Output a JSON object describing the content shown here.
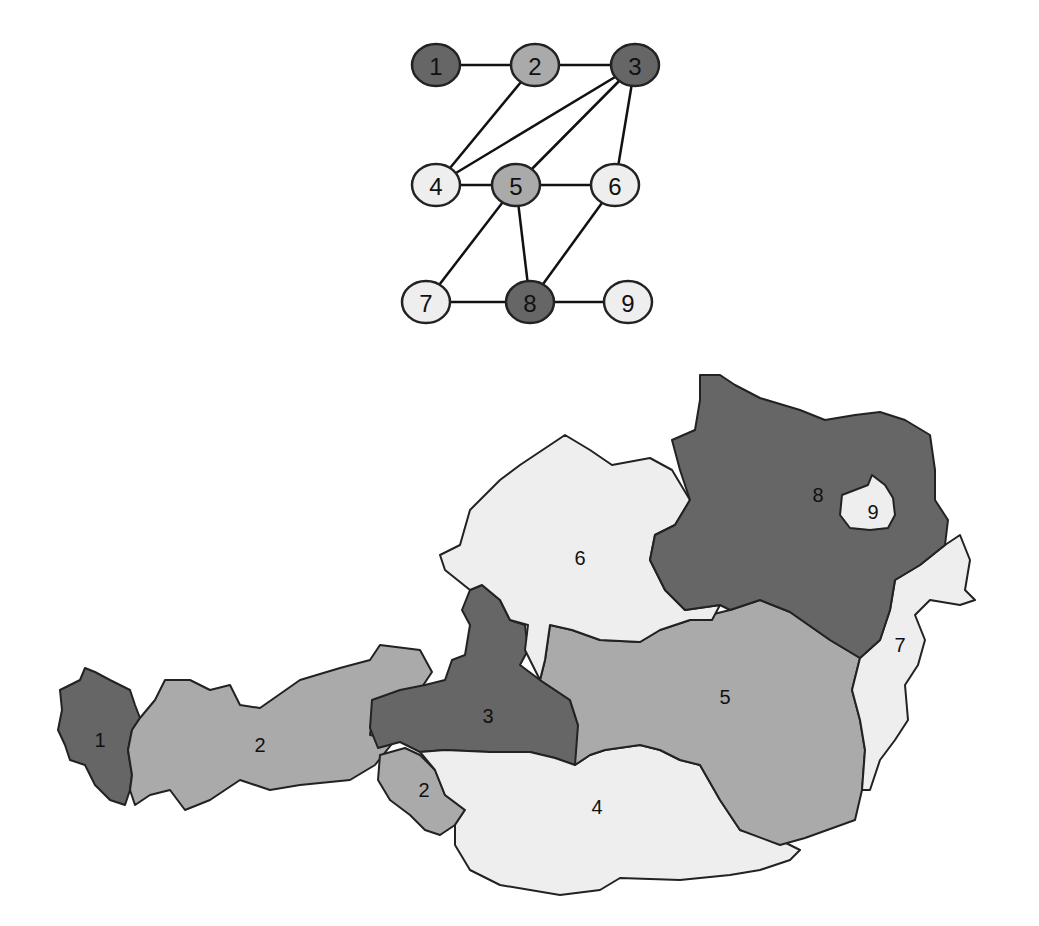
{
  "colors": {
    "dark": "#666666",
    "medium": "#aaaaaa",
    "light": "#eeeeee"
  },
  "graph": {
    "nodes": [
      {
        "id": "1",
        "label": "1",
        "x": 436,
        "y": 65,
        "shade": "dark"
      },
      {
        "id": "2",
        "label": "2",
        "x": 535,
        "y": 65,
        "shade": "medium"
      },
      {
        "id": "3",
        "label": "3",
        "x": 635,
        "y": 65,
        "shade": "dark"
      },
      {
        "id": "4",
        "label": "4",
        "x": 436,
        "y": 185,
        "shade": "light"
      },
      {
        "id": "5",
        "label": "5",
        "x": 516,
        "y": 185,
        "shade": "medium"
      },
      {
        "id": "6",
        "label": "6",
        "x": 615,
        "y": 185,
        "shade": "light"
      },
      {
        "id": "7",
        "label": "7",
        "x": 426,
        "y": 302,
        "shade": "light"
      },
      {
        "id": "8",
        "label": "8",
        "x": 530,
        "y": 302,
        "shade": "dark"
      },
      {
        "id": "9",
        "label": "9",
        "x": 628,
        "y": 302,
        "shade": "light"
      }
    ],
    "edges": [
      [
        "1",
        "2"
      ],
      [
        "2",
        "3"
      ],
      [
        "2",
        "4"
      ],
      [
        "3",
        "4"
      ],
      [
        "3",
        "5"
      ],
      [
        "3",
        "6"
      ],
      [
        "4",
        "5"
      ],
      [
        "5",
        "6"
      ],
      [
        "5",
        "7"
      ],
      [
        "5",
        "8"
      ],
      [
        "6",
        "8"
      ],
      [
        "7",
        "8"
      ],
      [
        "8",
        "9"
      ]
    ]
  },
  "map": {
    "regions": [
      {
        "id": "1",
        "label": "1",
        "shade": "dark",
        "lx": 100,
        "ly": 740,
        "points": "60,690 80,680 85,668 95,672 110,680 130,690 135,705 140,718 132,730 128,750 132,775 130,790 125,805 110,800 95,785 85,765 70,760 65,745 58,730 62,710"
      },
      {
        "id": "2a",
        "label": "2",
        "shade": "medium",
        "lx": 260,
        "ly": 745,
        "points": "140,718 155,700 165,680 190,680 210,690 230,685 240,705 260,708 300,680 340,668 370,660 380,645 420,650 432,672 420,690 400,700 375,700 370,735 395,740 375,765 350,780 300,785 270,790 240,780 210,800 185,810 170,790 150,795 135,805 130,790 132,775 128,750 132,730"
      },
      {
        "id": "2b",
        "label": "2",
        "shade": "medium",
        "lx": 424,
        "ly": 790,
        "points": "380,755 405,748 420,755 435,770 445,795 465,810 455,825 440,835 425,830 410,815 390,800 378,780"
      },
      {
        "id": "3",
        "label": "3",
        "shade": "dark",
        "lx": 488,
        "ly": 716,
        "points": "372,700 400,690 425,685 445,680 452,660 465,655 470,625 462,610 470,590 482,585 500,600 510,620 525,625 528,650 520,665 540,680 555,690 570,700 578,725 585,750 575,765 555,758 530,752 490,752 445,750 420,752 400,742 378,748 370,728"
      },
      {
        "id": "4",
        "label": "4",
        "shade": "light",
        "lx": 597,
        "ly": 807,
        "points": "420,752 445,750 490,752 530,752 555,758 575,765 590,755 605,750 640,745 660,750 680,760 700,765 720,800 740,830 780,840 800,850 790,860 760,870 730,875 680,880 620,878 600,890 560,895 500,885 470,870 455,845 455,825 465,810 445,795 435,770"
      },
      {
        "id": "5",
        "label": "5",
        "shade": "medium",
        "lx": 725,
        "ly": 697,
        "points": "550,625 572,630 600,640 640,642 660,630 690,620 730,610 760,600 790,612 830,640 860,658 852,690 860,720 865,750 862,790 855,820 805,838 780,845 740,830 720,800 700,765 680,760 660,750 640,745 605,750 590,755 575,765 578,725 570,700 555,690 540,680 545,660"
      },
      {
        "id": "6",
        "label": "6",
        "shade": "light",
        "lx": 580,
        "ly": 558,
        "points": "565,435 590,450 612,465 650,458 672,470 690,500 675,525 655,535 650,560 665,590 685,610 720,605 712,620 690,620 660,630 640,642 600,640 572,630 550,625 545,660 540,680 525,650 528,625 510,620 500,600 482,585 470,590 445,570 440,555 460,545 470,510 500,480 520,465"
      },
      {
        "id": "7",
        "label": "7",
        "shade": "light",
        "lx": 900,
        "ly": 645,
        "points": "895,580 920,565 945,545 960,535 970,560 965,590 975,600 960,605 930,600 915,615 925,640 918,665 905,685 908,720 895,740 880,760 870,790 862,790 865,750 860,720 852,690 860,658 880,640 890,610"
      },
      {
        "id": "8",
        "label": "8",
        "shade": "dark",
        "lx": 818,
        "ly": 495,
        "points": "700,375 720,375 735,385 760,398 800,410 825,420 855,415 880,412 905,420 930,435 935,470 935,500 948,520 945,545 920,565 895,580 890,610 880,640 860,658 830,640 790,612 760,600 730,610 720,605 685,610 665,590 650,560 655,535 675,525 690,500 680,470 672,440 695,430 700,400"
      },
      {
        "id": "9",
        "label": "9",
        "shade": "light",
        "lx": 873,
        "ly": 512,
        "points": "842,495 855,490 868,485 872,475 885,485 893,498 895,515 888,528 870,530 850,528 840,515"
      }
    ]
  }
}
